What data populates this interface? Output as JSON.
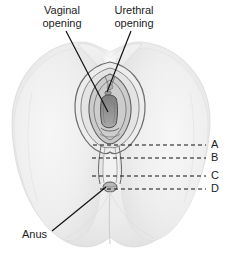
{
  "figure": {
    "background_color": "#ffffff",
    "line_color": "#1c1c1c",
    "skin_light": "#f4f4f4",
    "skin_mid": "#e6e6e6",
    "skin_shadow": "#cfcfcf",
    "cavity_dark": "#8a8a8a"
  },
  "callouts": {
    "vaginal": {
      "line1": "Vaginal",
      "line2": "opening"
    },
    "urethral": {
      "line1": "Urethral",
      "line2": "opening"
    },
    "anus": {
      "label": "Anus"
    }
  },
  "reference_markers": [
    {
      "letter": "A",
      "y": 145
    },
    {
      "letter": "B",
      "y": 158
    },
    {
      "letter": "C",
      "y": 176
    },
    {
      "letter": "D",
      "y": 189
    }
  ]
}
